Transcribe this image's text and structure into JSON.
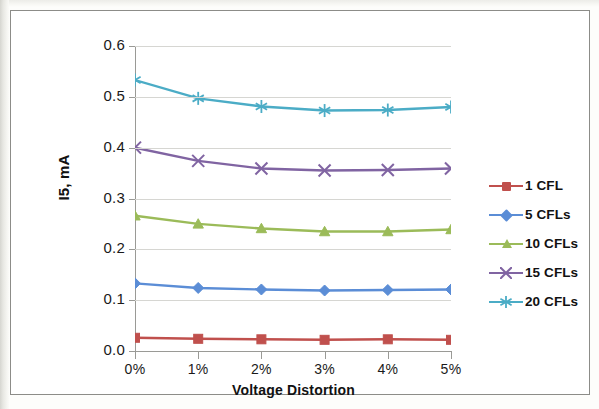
{
  "chart_data": {
    "type": "line",
    "title": "",
    "xlabel": "Voltage Distortion",
    "ylabel": "I5, mA",
    "categories": [
      "0%",
      "1%",
      "2%",
      "3%",
      "4%",
      "5%"
    ],
    "ylim": [
      0.0,
      0.6
    ],
    "yticks": [
      "0.0",
      "0.1",
      "0.2",
      "0.3",
      "0.4",
      "0.5",
      "0.6"
    ],
    "ytick_values": [
      0.0,
      0.1,
      0.2,
      0.3,
      0.4,
      0.5,
      0.6
    ],
    "grid": "horizontal",
    "legend_position": "right",
    "series": [
      {
        "name": "1 CFL",
        "color": "#C0504D",
        "marker": "square",
        "values": [
          0.026,
          0.024,
          0.023,
          0.022,
          0.023,
          0.022
        ]
      },
      {
        "name": "5 CFLs",
        "color": "#5B8DD6",
        "marker": "diamond",
        "values": [
          0.133,
          0.124,
          0.121,
          0.119,
          0.12,
          0.121
        ]
      },
      {
        "name": "10 CFLs",
        "color": "#9BBB59",
        "marker": "triangle",
        "values": [
          0.266,
          0.25,
          0.241,
          0.235,
          0.235,
          0.239
        ]
      },
      {
        "name": "15 CFLs",
        "color": "#8064A2",
        "marker": "x",
        "values": [
          0.4,
          0.374,
          0.359,
          0.355,
          0.356,
          0.359
        ]
      },
      {
        "name": "20 CFLs",
        "color": "#4BACC6",
        "marker": "asterisk",
        "values": [
          0.533,
          0.497,
          0.481,
          0.473,
          0.474,
          0.48
        ]
      }
    ]
  }
}
